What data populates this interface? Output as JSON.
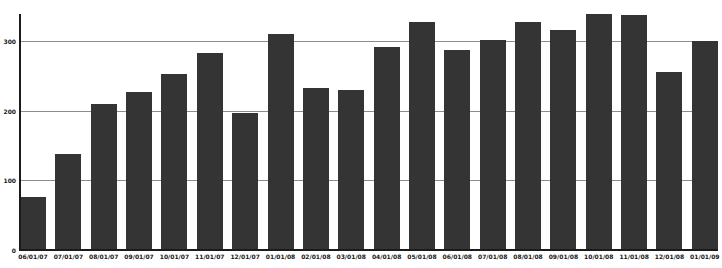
{
  "chart": {
    "background_color": "#ffffff",
    "bar_color": "#343434",
    "gridline_color": "#8c8c8c",
    "axis_color": "#1b1b1b",
    "label_color": "#161616"
  },
  "chart_data": {
    "type": "bar",
    "title": "",
    "xlabel": "",
    "ylabel": "",
    "categories": [
      "06/01/07",
      "07/01/07",
      "08/01/07",
      "09/01/07",
      "10/01/07",
      "11/01/07",
      "12/01/07",
      "01/01/08",
      "02/01/08",
      "03/01/08",
      "04/01/08",
      "05/01/08",
      "06/01/08",
      "07/01/08",
      "08/01/08",
      "09/01/08",
      "10/01/08",
      "11/01/08",
      "12/01/08",
      "01/01/09"
    ],
    "values": [
      77,
      138,
      210,
      228,
      254,
      284,
      197,
      311,
      234,
      230,
      293,
      328,
      288,
      302,
      328,
      317,
      340,
      339,
      257,
      301
    ],
    "y_ticks": [
      0,
      100,
      200,
      300
    ],
    "ylim": [
      0,
      340
    ],
    "grid": "horizontal",
    "legend": "none",
    "series_name": "monthly-values"
  }
}
